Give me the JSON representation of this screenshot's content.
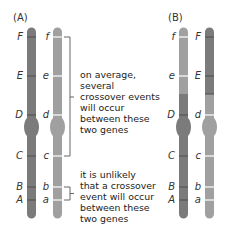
{
  "colors": {
    "dark_chromosome": "#7b7b7b",
    "light_chromosome": "#a0a0a0",
    "gene_band_dark": "#5a5a5a",
    "gene_band_light": "#ffffff",
    "bracket": "#555555"
  },
  "panel_a": {
    "label": "(A)",
    "left_chromosome": {
      "shade": "dark",
      "genes": [
        {
          "label": "F",
          "y": 37
        },
        {
          "label": "E",
          "y": 76
        },
        {
          "label": "D",
          "y": 115
        },
        {
          "label": "C",
          "y": 156
        },
        {
          "label": "B",
          "y": 187
        },
        {
          "label": "A",
          "y": 200
        }
      ]
    },
    "right_chromosome": {
      "shade": "light",
      "genes": [
        {
          "label": "f",
          "y": 37
        },
        {
          "label": "e",
          "y": 76
        },
        {
          "label": "d",
          "y": 115
        },
        {
          "label": "c",
          "y": 156
        },
        {
          "label": "b",
          "y": 187
        },
        {
          "label": "a",
          "y": 200
        }
      ]
    },
    "annotations": [
      {
        "text": "on average,\nseveral\ncrossover events\nwill occur\nbetween these\ntwo genes",
        "span": [
          "f",
          "c"
        ]
      },
      {
        "text": "it is unlikely\nthat a crossover\nevent will occur\nbetween these\ntwo genes",
        "span": [
          "b",
          "a"
        ]
      }
    ]
  },
  "panel_b": {
    "label": "(B)",
    "left_chromosome": {
      "shade": "light top / dark bottom (recombinant)",
      "genes": [
        {
          "label": "f",
          "y": 37
        },
        {
          "label": "e",
          "y": 76
        },
        {
          "label": "D",
          "y": 115
        },
        {
          "label": "C",
          "y": 156
        },
        {
          "label": "B",
          "y": 187
        },
        {
          "label": "A",
          "y": 200
        }
      ]
    },
    "right_chromosome": {
      "shade": "dark top / light bottom (recombinant)",
      "genes": [
        {
          "label": "F",
          "y": 37
        },
        {
          "label": "E",
          "y": 76
        },
        {
          "label": "d",
          "y": 115
        },
        {
          "label": "c",
          "y": 156
        },
        {
          "label": "b",
          "y": 187
        },
        {
          "label": "a",
          "y": 200
        }
      ]
    },
    "crossover_point_y": 94
  }
}
